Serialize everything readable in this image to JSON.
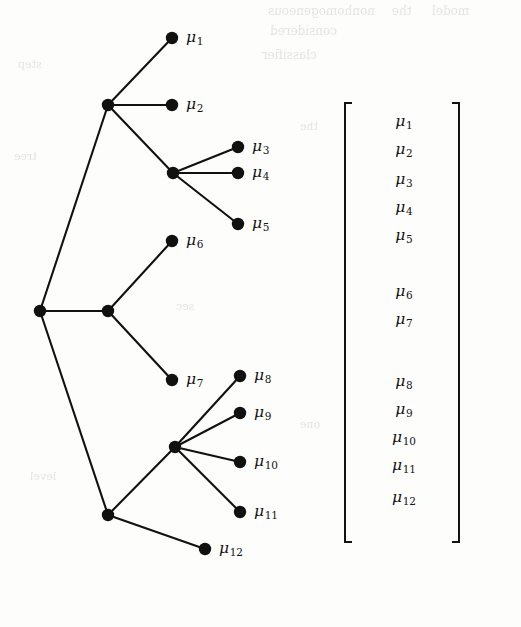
{
  "figure": {
    "background_color": "#fdfdfc",
    "ink_color": "#131313"
  },
  "tree": {
    "orientation": "left-to-right",
    "root": {
      "name": "root-node",
      "x": 40,
      "y": 311
    },
    "internal_nodes": [
      {
        "name": "internal-node-a",
        "x": 108,
        "y": 105
      },
      {
        "name": "internal-node-b",
        "x": 108,
        "y": 311
      },
      {
        "name": "internal-node-c",
        "x": 108,
        "y": 515
      },
      {
        "name": "internal-node-d",
        "x": 173,
        "y": 173
      },
      {
        "name": "internal-node-e",
        "x": 175,
        "y": 447
      }
    ],
    "leaves": [
      {
        "id": "mu1",
        "symbol": "μ",
        "subscript": "1",
        "x": 172,
        "y": 38,
        "label_x": 186,
        "label_y": 28
      },
      {
        "id": "mu2",
        "symbol": "μ",
        "subscript": "2",
        "x": 172,
        "y": 105,
        "label_x": 186,
        "label_y": 95
      },
      {
        "id": "mu3",
        "symbol": "μ",
        "subscript": "3",
        "x": 238,
        "y": 147,
        "label_x": 252,
        "label_y": 137
      },
      {
        "id": "mu4",
        "symbol": "μ",
        "subscript": "4",
        "x": 238,
        "y": 173,
        "label_x": 252,
        "label_y": 163
      },
      {
        "id": "mu5",
        "symbol": "μ",
        "subscript": "5",
        "x": 238,
        "y": 224,
        "label_x": 252,
        "label_y": 214
      },
      {
        "id": "mu6",
        "symbol": "μ",
        "subscript": "6",
        "x": 172,
        "y": 241,
        "label_x": 186,
        "label_y": 231
      },
      {
        "id": "mu7",
        "symbol": "μ",
        "subscript": "7",
        "x": 172,
        "y": 380,
        "label_x": 186,
        "label_y": 370
      },
      {
        "id": "mu8",
        "symbol": "μ",
        "subscript": "8",
        "x": 240,
        "y": 376,
        "label_x": 254,
        "label_y": 366
      },
      {
        "id": "mu9",
        "symbol": "μ",
        "subscript": "9",
        "x": 240,
        "y": 413,
        "label_x": 254,
        "label_y": 403
      },
      {
        "id": "mu10",
        "symbol": "μ",
        "subscript": "10",
        "x": 240,
        "y": 462,
        "label_x": 254,
        "label_y": 452
      },
      {
        "id": "mu11",
        "symbol": "μ",
        "subscript": "11",
        "x": 240,
        "y": 512,
        "label_x": 254,
        "label_y": 502
      },
      {
        "id": "mu12",
        "symbol": "μ",
        "subscript": "12",
        "x": 205,
        "y": 549,
        "label_x": 219,
        "label_y": 539
      }
    ],
    "edges": [
      {
        "from": "root-node",
        "to": "internal-node-a"
      },
      {
        "from": "root-node",
        "to": "internal-node-b"
      },
      {
        "from": "root-node",
        "to": "internal-node-c"
      },
      {
        "from": "internal-node-a",
        "to": "mu1"
      },
      {
        "from": "internal-node-a",
        "to": "mu2"
      },
      {
        "from": "internal-node-a",
        "to": "internal-node-d"
      },
      {
        "from": "internal-node-d",
        "to": "mu3"
      },
      {
        "from": "internal-node-d",
        "to": "mu4"
      },
      {
        "from": "internal-node-d",
        "to": "mu5"
      },
      {
        "from": "internal-node-b",
        "to": "mu6"
      },
      {
        "from": "internal-node-b",
        "to": "mu7"
      },
      {
        "from": "internal-node-c",
        "to": "internal-node-e"
      },
      {
        "from": "internal-node-c",
        "to": "mu12"
      },
      {
        "from": "internal-node-e",
        "to": "mu8"
      },
      {
        "from": "internal-node-e",
        "to": "mu9"
      },
      {
        "from": "internal-node-e",
        "to": "mu10"
      },
      {
        "from": "internal-node-e",
        "to": "mu11"
      }
    ],
    "node_radius": 6.2
  },
  "bracket_expression": {
    "description": "Nested square-bracket partition of the mean vector",
    "brackets": [
      {
        "name": "bracket-outer",
        "level": 0,
        "x": 0,
        "y": 2,
        "width": 116,
        "height": 441
      },
      {
        "name": "bracket-group-1-5",
        "level": 1,
        "x": 18,
        "y": 2,
        "width": 84,
        "height": 142
      },
      {
        "name": "bracket-group-3-5",
        "level": 2,
        "x": 36,
        "y": 60,
        "width": 48,
        "height": 84
      },
      {
        "name": "bracket-group-6-7",
        "level": 1,
        "x": 36,
        "y": 172,
        "width": 48,
        "height": 60
      },
      {
        "name": "bracket-group-8-12",
        "level": 1,
        "x": 18,
        "y": 262,
        "width": 84,
        "height": 181
      },
      {
        "name": "bracket-group-8-11",
        "level": 2,
        "x": 36,
        "y": 262,
        "width": 48,
        "height": 133
      }
    ],
    "entries": [
      {
        "id": "mu1",
        "symbol": "μ",
        "subscript": "1",
        "x": 60,
        "y": 12
      },
      {
        "id": "mu2",
        "symbol": "μ",
        "subscript": "2",
        "x": 60,
        "y": 40
      },
      {
        "id": "mu3",
        "symbol": "μ",
        "subscript": "3",
        "x": 60,
        "y": 70
      },
      {
        "id": "mu4",
        "symbol": "μ",
        "subscript": "4",
        "x": 60,
        "y": 98
      },
      {
        "id": "mu5",
        "symbol": "μ",
        "subscript": "5",
        "x": 60,
        "y": 126
      },
      {
        "id": "mu6",
        "symbol": "μ",
        "subscript": "6",
        "x": 60,
        "y": 182
      },
      {
        "id": "mu7",
        "symbol": "μ",
        "subscript": "7",
        "x": 60,
        "y": 210
      },
      {
        "id": "mu8",
        "symbol": "μ",
        "subscript": "8",
        "x": 60,
        "y": 272
      },
      {
        "id": "mu9",
        "symbol": "μ",
        "subscript": "9",
        "x": 60,
        "y": 300
      },
      {
        "id": "mu10",
        "symbol": "μ",
        "subscript": "10",
        "x": 60,
        "y": 328
      },
      {
        "id": "mu11",
        "symbol": "μ",
        "subscript": "11",
        "x": 60,
        "y": 356
      },
      {
        "id": "mu12",
        "symbol": "μ",
        "subscript": "12",
        "x": 60,
        "y": 388
      }
    ]
  },
  "bleed_through": [
    {
      "text": "nonhomogeneous",
      "x": 268,
      "y": 4,
      "size": 12
    },
    {
      "text": "the",
      "x": 392,
      "y": 4,
      "size": 12
    },
    {
      "text": "model",
      "x": 432,
      "y": 4,
      "size": 12
    },
    {
      "text": "considered",
      "x": 270,
      "y": 24,
      "size": 12
    },
    {
      "text": "classifier",
      "x": 262,
      "y": 48,
      "size": 12
    },
    {
      "text": "step",
      "x": 18,
      "y": 58,
      "size": 11
    },
    {
      "text": "the",
      "x": 300,
      "y": 120,
      "size": 11
    },
    {
      "text": "tree",
      "x": 14,
      "y": 150,
      "size": 11
    },
    {
      "text": "sec",
      "x": 176,
      "y": 300,
      "size": 11
    },
    {
      "text": "one",
      "x": 300,
      "y": 418,
      "size": 11
    },
    {
      "text": "level",
      "x": 30,
      "y": 470,
      "size": 11
    }
  ]
}
